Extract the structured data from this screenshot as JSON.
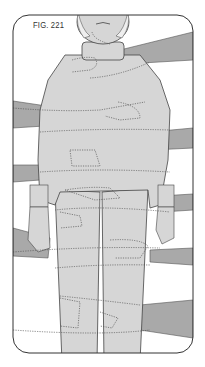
{
  "figure": {
    "label": "FIG. 221",
    "colors": {
      "background": "#ffffff",
      "frame": "#333333",
      "body": "#d6d6d6",
      "arms": "#a9a9a9",
      "outline": "#444444",
      "dotted": "#555555"
    }
  }
}
